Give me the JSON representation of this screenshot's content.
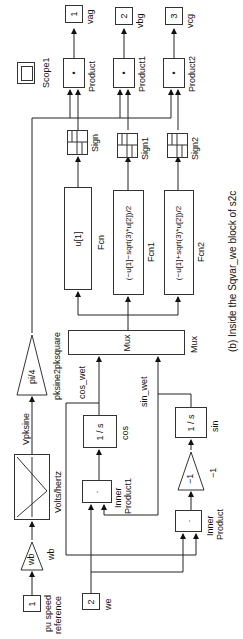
{
  "figure": {
    "caption": "(b) Inside the Sqvar_we block of s2c",
    "orientation": "rotated 90° counterclockwise"
  },
  "blocks": {
    "outport1": {
      "number": "1",
      "label": "vag"
    },
    "outport2": {
      "number": "2",
      "label": "vbg"
    },
    "outport3": {
      "number": "3",
      "label": "vcg"
    },
    "product": {
      "symbol": "•",
      "label": "Product"
    },
    "product1": {
      "symbol": "•",
      "label": "Product1"
    },
    "product2": {
      "symbol": "•",
      "label": "Product2"
    },
    "scope1": {
      "label": "Scope1"
    },
    "sign": {
      "label": "Sign"
    },
    "sign1": {
      "label": "Sign1"
    },
    "sign2": {
      "label": "Sign2"
    },
    "fcn": {
      "expr": "u[1]",
      "label": "Fcn"
    },
    "fcn1": {
      "expr": "(−u[1]−sqrt(3)*u[2])/2",
      "label": "Fcn1"
    },
    "fcn2": {
      "expr": "(−u[1]+sqrt(3)*u[2])/2",
      "label": "Fcn2"
    },
    "mux": {
      "inner": "Mux",
      "label": "Mux"
    },
    "pi4_gain": {
      "value": "pi/4",
      "label": "pksine2pksquare"
    },
    "volts_hertz": {
      "label": "Volts/hertz"
    },
    "wb_gain": {
      "value": "wb",
      "label": "wb"
    },
    "inport1": {
      "number": "1",
      "label_line1": "pu speed",
      "label_line2": "reference"
    },
    "inport2": {
      "number": "2",
      "label": "we"
    },
    "cos_integrator": {
      "num": "1",
      "den": "s",
      "label": "cos"
    },
    "sin_integrator": {
      "num": "1",
      "den": "s",
      "label": "sin"
    },
    "inner_product1": {
      "symbol": "·",
      "label_line1": "Inner",
      "label_line2": "Product1"
    },
    "inner_product": {
      "symbol": "·",
      "label_line1": "Inner",
      "label_line2": "Product"
    },
    "neg_gain": {
      "value": "−1",
      "label": "−1"
    }
  },
  "signals": {
    "vpksine": "Vpksine",
    "cos_wet": "cos_wet",
    "sin_wet": "sin_wet"
  }
}
